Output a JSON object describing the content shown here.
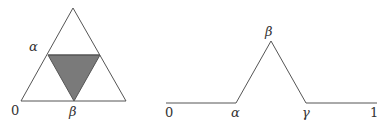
{
  "left_figure": {
    "outer_triangle": {
      "apex": [
        73,
        8
      ],
      "base_left": [
        21,
        101
      ],
      "base_right": [
        126,
        101
      ]
    },
    "inner_triangle": {
      "top_left": [
        48,
        55
      ],
      "top_right": [
        100,
        55
      ],
      "bottom": [
        74,
        101
      ],
      "fill": "#7a7a7a"
    },
    "labels": {
      "alpha": "α",
      "zero": "0",
      "beta": "β"
    }
  },
  "right_figure": {
    "polyline": [
      [
        166,
        103
      ],
      [
        236,
        103
      ],
      [
        271,
        41
      ],
      [
        306,
        103
      ],
      [
        377,
        103
      ]
    ],
    "labels": {
      "zero": "0",
      "alpha": "α",
      "beta": "β",
      "gamma": "γ",
      "one": "1"
    }
  },
  "colors": {
    "line": "#555555",
    "shade": "#7a7a7a",
    "text": "#333333"
  }
}
